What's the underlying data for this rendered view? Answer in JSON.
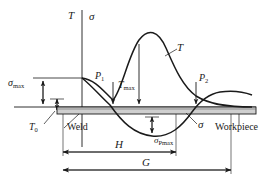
{
  "figure": {
    "background_color": "#ffffff",
    "line_color": "#1a1a1a",
    "workpiece_fill": "#cfcfcf"
  },
  "axes": {
    "temperature_axis_label": "T",
    "stress_axis_label": "σ"
  },
  "curve_labels": {
    "temperature_curve": "T",
    "stress_curve": "σ"
  },
  "points": {
    "p1": {
      "symbol": "P",
      "subscript": "1"
    },
    "p2": {
      "symbol": "P",
      "subscript": "2"
    }
  },
  "value_labels": {
    "sigma_max": {
      "symbol": "σ",
      "subscript": "max"
    },
    "t_zero": {
      "symbol": "T",
      "subscript": "0"
    },
    "t_max": {
      "symbol": "T",
      "subscript": "max"
    },
    "sigma_pmax": {
      "symbol": "σ",
      "subscript": "Pmax"
    }
  },
  "annotations": {
    "weld": "Weld",
    "workpiece": "Workpiece"
  },
  "dimensions": {
    "h": "H",
    "g": "G"
  }
}
